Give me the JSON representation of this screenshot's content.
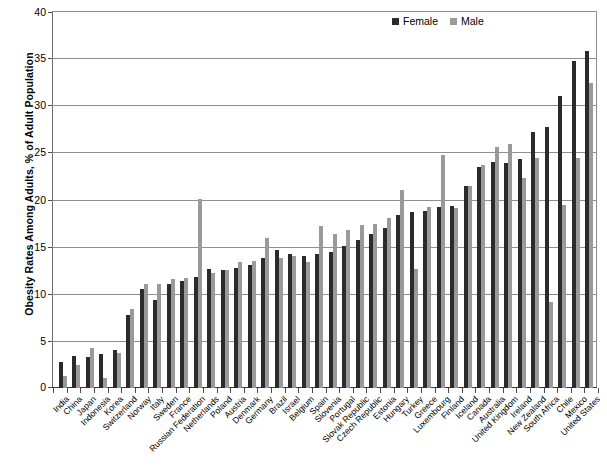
{
  "chart_data": {
    "type": "bar",
    "title": "",
    "xlabel": "",
    "ylabel": "Obesity Rates Among Adults, % of Adult Population",
    "ylim": [
      0,
      40
    ],
    "yticks": [
      0,
      5,
      10,
      15,
      20,
      25,
      30,
      35,
      40
    ],
    "grid": true,
    "legend_position": "top-right",
    "colors": {
      "female": "#2b2b2b",
      "male": "#9a9a9a",
      "gridline": "#8e8e8e",
      "axis": "#3a3a3a",
      "background": "#ffffff"
    },
    "categories": [
      "India",
      "China",
      "Japan",
      "Indonesia",
      "Korea",
      "Switzerland",
      "Norway",
      "Italy",
      "Sweden",
      "France",
      "Russian Federation",
      "Netherlands",
      "Poland",
      "Austria",
      "Denmark",
      "Germany",
      "Brazil",
      "Israel",
      "Belgium",
      "Spain",
      "Slovenia",
      "Portugal",
      "Slovak Republic",
      "Czech Republic",
      "Estonia",
      "Hungary",
      "Turkey",
      "Greece",
      "Luxembourg",
      "Finland",
      "Iceland",
      "Canada",
      "Australia",
      "United Kingdom",
      "Ireland",
      "New Zealand",
      "South Africa",
      "Chile",
      "Mexico",
      "United States"
    ],
    "series": [
      {
        "name": "Female",
        "color": "#2b2b2b",
        "values": [
          2.8,
          3.4,
          3.3,
          3.6,
          4.0,
          7.7,
          10.5,
          9.3,
          11.0,
          11.4,
          11.8,
          12.6,
          12.5,
          12.7,
          13.0,
          13.8,
          14.6,
          14.2,
          14.0,
          14.2,
          14.4,
          15.1,
          15.7,
          16.3,
          17.0,
          18.4,
          18.7,
          18.8,
          19.2,
          19.3,
          21.4,
          23.4,
          24.0,
          23.9,
          24.3,
          27.2,
          27.7,
          31.0,
          34.7,
          35.8
        ]
      },
      {
        "name": "Male",
        "color": "#9a9a9a",
        "values": [
          1.3,
          2.4,
          4.2,
          1.1,
          3.7,
          8.4,
          11.0,
          11.0,
          11.6,
          11.7,
          20.1,
          12.2,
          12.5,
          13.4,
          13.5,
          15.9,
          13.8,
          14.0,
          13.4,
          17.2,
          16.3,
          16.8,
          17.3,
          17.4,
          18.0,
          21.0,
          12.6,
          19.2,
          24.7,
          19.1,
          21.4,
          23.7,
          25.6,
          25.9,
          22.3,
          24.4,
          9.1,
          19.4,
          24.4,
          32.4
        ]
      }
    ]
  },
  "legend": {
    "entries": [
      {
        "label": "Female"
      },
      {
        "label": "Male"
      }
    ]
  }
}
